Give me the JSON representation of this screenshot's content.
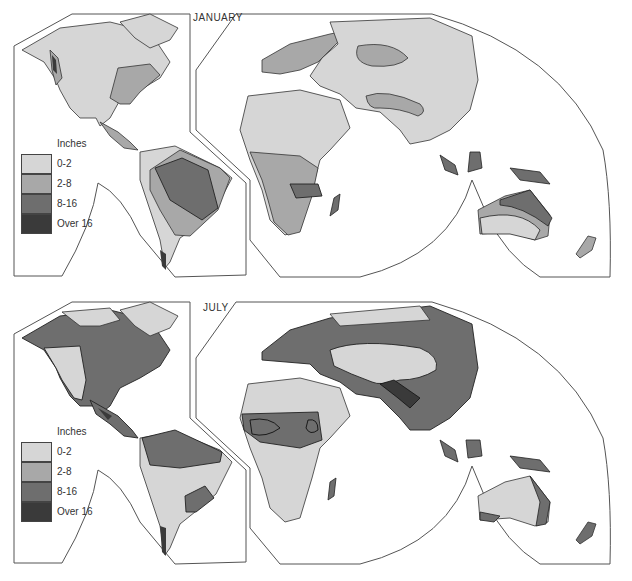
{
  "maps": [
    {
      "title": "JANUARY",
      "legend": {
        "header": "Inches",
        "items": [
          {
            "label": "0-2",
            "color": "#d6d6d6"
          },
          {
            "label": "2-8",
            "color": "#a8a8a8"
          },
          {
            "label": "8-16",
            "color": "#6e6e6e"
          },
          {
            "label": "Over 16",
            "color": "#3a3a3a"
          }
        ]
      }
    },
    {
      "title": "JULY",
      "legend": {
        "header": "Inches",
        "items": [
          {
            "label": "0-2",
            "color": "#d6d6d6"
          },
          {
            "label": "2-8",
            "color": "#a8a8a8"
          },
          {
            "label": "8-16",
            "color": "#6e6e6e"
          },
          {
            "label": "Over 16",
            "color": "#3a3a3a"
          }
        ]
      }
    }
  ],
  "colors": {
    "light": "#d6d6d6",
    "medium": "#a8a8a8",
    "dark": "#6e6e6e",
    "darkest": "#3a3a3a",
    "outline": "#444444"
  }
}
